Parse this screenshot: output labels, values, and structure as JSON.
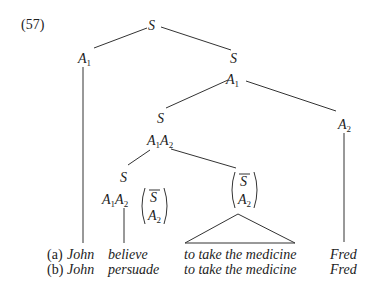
{
  "example_number": "(57)",
  "nodes": {
    "root": "S",
    "a1_left": "A",
    "a1_left_sub": "1",
    "s_right": "S",
    "a1_mid": "A",
    "a1_mid_sub": "1",
    "s_mid": "S",
    "a2_right": "A",
    "a2_right_sub": "2",
    "a1a2_mid": "A",
    "a1a2_mid_sub1": "1",
    "a1a2_mid_b": "A",
    "a1a2_mid_sub2": "2",
    "s_low": "S",
    "a1a2_low": "A",
    "a1a2_low_sub1": "1",
    "a1a2_low_b": "A",
    "a1a2_low_sub2": "2",
    "bracket_low_top": "S",
    "bracket_low_bottom": "A",
    "bracket_low_bottom_sub": "2",
    "bracket_right_top": "S",
    "bracket_right_bottom": "A",
    "bracket_right_bottom_sub": "2"
  },
  "rows": [
    {
      "label": "(a)",
      "subject": "John",
      "verb": "believe",
      "complement": "to take the medicine",
      "object": "Fred"
    },
    {
      "label": "(b)",
      "subject": "John",
      "verb": "persuade",
      "complement": "to take the medicine",
      "object": "Fred"
    }
  ]
}
